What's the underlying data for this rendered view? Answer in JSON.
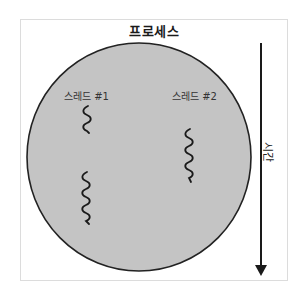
{
  "diagram": {
    "title": "프로세스",
    "process_circle": {
      "fill": "#c4c4c4",
      "stroke": "#222222"
    },
    "threads": [
      {
        "label": "스레드 #1",
        "waves": 2
      },
      {
        "label": "스레드 #2",
        "waves": 4
      }
    ],
    "unlabeled_thread": {
      "waves": 4
    },
    "time_axis": {
      "label": "시간",
      "direction": "down",
      "color": "#1a1a1a"
    }
  }
}
